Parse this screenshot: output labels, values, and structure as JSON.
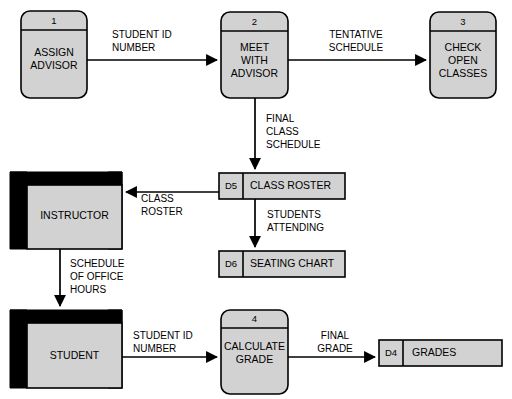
{
  "diagram": {
    "type": "data-flow-diagram",
    "colors": {
      "shape_fill": "#d2d2d2",
      "outline": "#000000",
      "shadow": "#000000",
      "background": "#ffffff"
    },
    "processes": [
      {
        "id": "p1",
        "number": "1",
        "lines": [
          "ASSIGN",
          "ADVISOR"
        ]
      },
      {
        "id": "p2",
        "number": "2",
        "lines": [
          "MEET",
          "WITH",
          "ADVISOR"
        ]
      },
      {
        "id": "p3",
        "number": "3",
        "lines": [
          "CHECK",
          "OPEN",
          "CLASSES"
        ]
      },
      {
        "id": "p4",
        "number": "4",
        "lines": [
          "CALCULATE",
          "GRADE"
        ]
      }
    ],
    "entities": [
      {
        "id": "e1",
        "label": "INSTRUCTOR"
      },
      {
        "id": "e2",
        "label": "STUDENT"
      }
    ],
    "data_stores": [
      {
        "id": "d5",
        "code": "D5",
        "label": "CLASS ROSTER"
      },
      {
        "id": "d6",
        "code": "D6",
        "label": "SEATING CHART"
      },
      {
        "id": "d4",
        "code": "D4",
        "label": "GRADES"
      }
    ],
    "flows": [
      {
        "id": "f1",
        "from": "p1",
        "to": "p2",
        "lines": [
          "STUDENT ID",
          "NUMBER"
        ],
        "align": "start"
      },
      {
        "id": "f2",
        "from": "p2",
        "to": "p3",
        "lines": [
          "TENTATIVE",
          "SCHEDULE"
        ],
        "align": "middle"
      },
      {
        "id": "f3",
        "from": "p2",
        "to": "d5",
        "lines": [
          "FINAL",
          "CLASS",
          "SCHEDULE"
        ],
        "align": "start"
      },
      {
        "id": "f4",
        "from": "d5",
        "to": "e1",
        "lines": [
          "CLASS",
          "ROSTER"
        ],
        "align": "start"
      },
      {
        "id": "f5",
        "from": "d5",
        "to": "d6",
        "lines": [
          "STUDENTS",
          "ATTENDING"
        ],
        "align": "middle"
      },
      {
        "id": "f6",
        "from": "e1",
        "to": "e2",
        "lines": [
          "SCHEDULE",
          "OF OFFICE",
          "HOURS"
        ],
        "align": "start"
      },
      {
        "id": "f7",
        "from": "e2",
        "to": "p4",
        "lines": [
          "STUDENT ID",
          "NUMBER"
        ],
        "align": "start"
      },
      {
        "id": "f8",
        "from": "p4",
        "to": "d4",
        "lines": [
          "FINAL",
          "GRADE"
        ],
        "align": "middle"
      }
    ]
  }
}
